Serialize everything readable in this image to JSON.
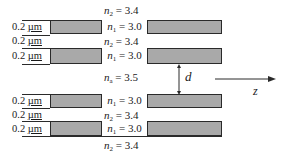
{
  "diagram": {
    "layers": {
      "n2_label": "n",
      "n2_sub": "2",
      "n2_value": " = 3.4",
      "n1_label": "n",
      "n1_sub": "1",
      "n1_value": " = 3.0",
      "na_label": "n",
      "na_sub": "a",
      "na_value": " = 3.5"
    },
    "thickness_number": "0.2 ",
    "thickness_unit": "µm",
    "gap_label": "d",
    "axis_label": "z",
    "colors": {
      "band_fill": "#a9a9a9",
      "line": "#2a2a2a",
      "background": "#ffffff"
    }
  }
}
